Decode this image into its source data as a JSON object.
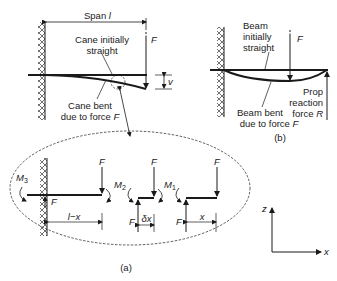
{
  "figure": {
    "panel_a": {
      "span_label_prefix": "Span ",
      "span_label_var": "l",
      "force_label": "F",
      "deflection_label": "v",
      "initial_label_line1": "Cane initially",
      "initial_label_line2": "straight",
      "bent_label_line1": "Cane bent",
      "bent_label_line2": "due to force ",
      "bent_label_force": "F",
      "caption": "(a)"
    },
    "panel_b": {
      "force_label": "F",
      "initial_label_line1": "Beam",
      "initial_label_line2": "initially",
      "initial_label_line3": "straight",
      "bent_label_line1": "Beam bent",
      "bent_label_line2": "due to force ",
      "bent_label_force": "F",
      "prop_label_line1": "Prop",
      "prop_label_line2": "reaction",
      "prop_label_line3": "force ",
      "prop_label_force": "R",
      "caption": "(b)"
    },
    "detail": {
      "segment_left": {
        "moment": "M",
        "moment_sub": "3",
        "force_top": "F",
        "force_bottom": "F",
        "dimension": "l−x"
      },
      "segment_middle": {
        "moment": "M",
        "moment_sub": "2",
        "force_top": "F",
        "force_bottom": "F",
        "dimension": "δx"
      },
      "segment_right": {
        "moment": "M",
        "moment_sub": "1",
        "force_top": "F",
        "force_bottom": "F",
        "dimension": "x"
      }
    },
    "axes": {
      "vertical": "z",
      "horizontal": "x"
    }
  }
}
